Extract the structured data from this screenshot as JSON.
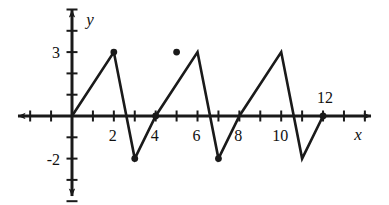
{
  "figure": {
    "kind": "cartesian-graph",
    "background": "#ffffff",
    "stroke_color": "#1a1a1a"
  },
  "axes": {
    "x_axis": {
      "label": "x",
      "arrow_both_ends": true,
      "tick_labels": [
        "2",
        "4",
        "6",
        "8",
        "10",
        "12"
      ],
      "tick_values": [
        2,
        4,
        6,
        8,
        10,
        12
      ],
      "ticks_every": 1,
      "range": [
        -2.6,
        14.3
      ]
    },
    "y_axis": {
      "label": "y",
      "arrow_both_ends": true,
      "tick_labels": [
        "3",
        "-2"
      ],
      "tick_values": [
        3,
        -2
      ],
      "ticks_every": 1,
      "range": [
        -4.9,
        5.0
      ]
    }
  },
  "chart_data": {
    "type": "line",
    "title": "",
    "xlabel": "x",
    "ylabel": "y",
    "xlim": [
      -2.6,
      14.3
    ],
    "ylim": [
      -4.9,
      5.0
    ],
    "grid": false,
    "legend": null,
    "series": [
      {
        "name": "triangle-wave",
        "x": [
          0,
          2,
          3,
          4,
          6,
          7,
          8,
          10,
          11,
          12
        ],
        "y": [
          0,
          3,
          -2,
          0,
          3,
          -2,
          0,
          3,
          -2,
          0
        ]
      }
    ],
    "marked_points": [
      {
        "x": 2,
        "y": 3
      },
      {
        "x": 3,
        "y": -2
      },
      {
        "x": 4,
        "y": 0
      },
      {
        "x": 5,
        "y": 3
      },
      {
        "x": 7,
        "y": -2
      },
      {
        "x": 12,
        "y": 0
      }
    ],
    "annotations": [
      {
        "text": "12",
        "x": 12,
        "y": 0,
        "placement": "above"
      }
    ]
  }
}
